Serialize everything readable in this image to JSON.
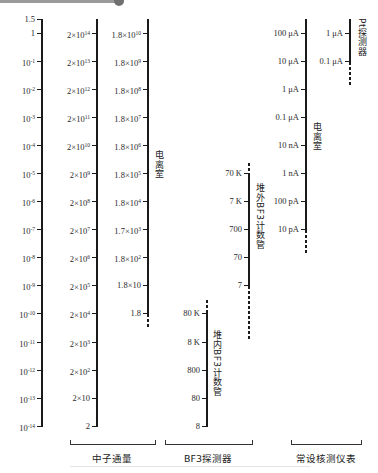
{
  "diagram": {
    "title": "",
    "axes": [
      {
        "id": "scale-1",
        "x": 41,
        "top": 19,
        "bottom": 427,
        "dashed_top": null,
        "dashed_bottom": null,
        "label_side": "left",
        "ticks": [
          {
            "label": "1.5",
            "y": 19
          },
          {
            "label": "1",
            "y": 33
          },
          {
            "label": "10^-1",
            "y": 61
          },
          {
            "label": "10^-2",
            "y": 89
          },
          {
            "label": "10^-3",
            "y": 117
          },
          {
            "label": "10^-4",
            "y": 145
          },
          {
            "label": "10^-5",
            "y": 173
          },
          {
            "label": "10^-6",
            "y": 201
          },
          {
            "label": "10^-7",
            "y": 229
          },
          {
            "label": "10^-8",
            "y": 257
          },
          {
            "label": "10^-9",
            "y": 285
          },
          {
            "label": "10^-10",
            "y": 313
          },
          {
            "label": "10^-11",
            "y": 342
          },
          {
            "label": "10^-12",
            "y": 370
          },
          {
            "label": "10^-13",
            "y": 398
          },
          {
            "label": "10^-14",
            "y": 426
          }
        ]
      },
      {
        "id": "neutron-flux",
        "x": 96,
        "top": 19,
        "bottom": 427,
        "label_side": "left",
        "ticks": [
          {
            "label": "2×10^14",
            "y": 33
          },
          {
            "label": "2×10^13",
            "y": 61
          },
          {
            "label": "2×10^12",
            "y": 89
          },
          {
            "label": "2×10^11",
            "y": 117
          },
          {
            "label": "2×10^10",
            "y": 145
          },
          {
            "label": "2×10^9",
            "y": 173
          },
          {
            "label": "2×10^8",
            "y": 201
          },
          {
            "label": "2×10^7",
            "y": 229
          },
          {
            "label": "2×10^6",
            "y": 257
          },
          {
            "label": "2×10^5",
            "y": 285
          },
          {
            "label": "2×10^4",
            "y": 313
          },
          {
            "label": "2×10^3",
            "y": 342
          },
          {
            "label": "2×10^2",
            "y": 370
          },
          {
            "label": "2×10",
            "y": 398
          },
          {
            "label": "2",
            "y": 426
          }
        ]
      },
      {
        "id": "ionization-chamber-1",
        "x": 147,
        "top": 19,
        "bottom": 314,
        "dashed_bottom": 327,
        "label_side": "left",
        "vertical_label": "电离室",
        "vertical_label_x": 153,
        "vertical_label_y": 150,
        "ticks": [
          {
            "label": "1.8×10^10",
            "y": 33
          },
          {
            "label": "1.8×10^9",
            "y": 61
          },
          {
            "label": "1.8×10^8",
            "y": 89
          },
          {
            "label": "1.8×10^7",
            "y": 117
          },
          {
            "label": "1.8×10^6",
            "y": 145
          },
          {
            "label": "1.8×10^5",
            "y": 173
          },
          {
            "label": "1.8×10^4",
            "y": 201
          },
          {
            "label": "1.7×10^3",
            "y": 229
          },
          {
            "label": "1.8×10^2",
            "y": 257
          },
          {
            "label": "1.8×10",
            "y": 285
          },
          {
            "label": "1.8",
            "y": 313
          }
        ]
      },
      {
        "id": "bf3-out-of-core",
        "x": 248,
        "top": 173,
        "bottom": 286,
        "dashed_top": 163,
        "dashed_bottom": 340,
        "label_side": "left",
        "vertical_label": "堆外BF3计数管",
        "vertical_label_x": 254,
        "vertical_label_y": 183,
        "ticks": [
          {
            "label": "70 K",
            "y": 173
          },
          {
            "label": "7 K",
            "y": 201
          },
          {
            "label": "700",
            "y": 229
          },
          {
            "label": "70",
            "y": 257
          },
          {
            "label": "7",
            "y": 285
          }
        ]
      },
      {
        "id": "bf3-in-core",
        "x": 206,
        "top": 313,
        "bottom": 427,
        "dashed_top": 300,
        "label_side": "left",
        "vertical_label": "堆内BF3计数管",
        "vertical_label_x": 211,
        "vertical_label_y": 330,
        "ticks": [
          {
            "label": "80 K",
            "y": 313
          },
          {
            "label": "8 K",
            "y": 342
          },
          {
            "label": "800",
            "y": 370
          },
          {
            "label": "80",
            "y": 398
          },
          {
            "label": "8",
            "y": 426
          }
        ]
      },
      {
        "id": "ionization-chamber-2",
        "x": 305,
        "top": 19,
        "bottom": 230,
        "dashed_bottom": 254,
        "label_side": "left",
        "vertical_label": "电离室",
        "vertical_label_x": 311,
        "vertical_label_y": 122,
        "ticks": [
          {
            "label": "100 μA",
            "y": 33
          },
          {
            "label": "10 μA",
            "y": 61
          },
          {
            "label": "1 μA",
            "y": 89
          },
          {
            "label": "0.1 μA",
            "y": 117
          },
          {
            "label": "10 nA",
            "y": 145
          },
          {
            "label": "1 nA",
            "y": 173
          },
          {
            "label": "100 pA",
            "y": 201
          },
          {
            "label": "10 pA",
            "y": 229
          }
        ]
      },
      {
        "id": "pt-detector",
        "x": 349,
        "top": 19,
        "bottom": 62,
        "dashed_bottom": 86,
        "label_side": "left",
        "vertical_label": "Pt探测器",
        "vertical_label_x": 356,
        "vertical_label_y": 18,
        "ticks": [
          {
            "label": "1 μA",
            "y": 33
          },
          {
            "label": "0.1 μA",
            "y": 61
          }
        ]
      }
    ],
    "groups": [
      {
        "label": "中子通量",
        "x1": 70,
        "x2": 154
      },
      {
        "label": "BF3探测器",
        "x1": 165,
        "x2": 251
      },
      {
        "label": "常设核测仪表",
        "x1": 291,
        "x2": 360
      }
    ]
  }
}
